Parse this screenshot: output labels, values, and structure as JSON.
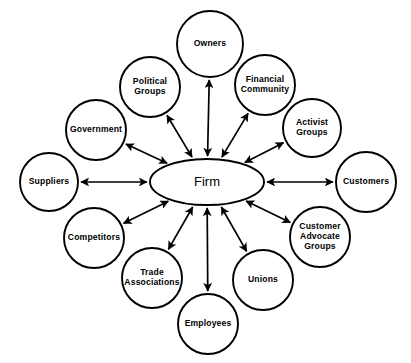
{
  "diagram": {
    "type": "hub-and-spoke stakeholder map",
    "title": "",
    "hub": {
      "id": "firm",
      "label": "Firm",
      "shape": "ellipse",
      "cx": 207,
      "cy": 182,
      "rx": 57,
      "ry": 23
    },
    "colors": {
      "background": "#ffffff",
      "stroke": "#000000",
      "node_fill": "#ffffff",
      "text": "#000000"
    },
    "arrow_style": "double-headed",
    "nodes": [
      {
        "id": "owners",
        "label": "Owners",
        "lines": [
          "Owners"
        ],
        "cx": 210,
        "cy": 44,
        "r": 33,
        "connection": "bidirectional"
      },
      {
        "id": "political-groups",
        "label": "Political Groups",
        "lines": [
          "Political",
          "Groups"
        ],
        "cx": 150,
        "cy": 87,
        "r": 30,
        "connection": "bidirectional"
      },
      {
        "id": "financial-community",
        "label": "Financial Community",
        "lines": [
          "Financial",
          "Community"
        ],
        "cx": 265,
        "cy": 85,
        "r": 30,
        "connection": "bidirectional"
      },
      {
        "id": "government",
        "label": "Government",
        "lines": [
          "Government"
        ],
        "cx": 96,
        "cy": 130,
        "r": 30,
        "connection": "bidirectional"
      },
      {
        "id": "activist-groups",
        "label": "Activist Groups",
        "lines": [
          "Activist",
          "Groups"
        ],
        "cx": 312,
        "cy": 128,
        "r": 29,
        "connection": "bidirectional"
      },
      {
        "id": "suppliers",
        "label": "Suppliers",
        "lines": [
          "Suppliers"
        ],
        "cx": 49,
        "cy": 182,
        "r": 29,
        "connection": "bidirectional"
      },
      {
        "id": "customers",
        "label": "Customers",
        "lines": [
          "Customers"
        ],
        "cx": 366,
        "cy": 182,
        "r": 30,
        "connection": "bidirectional"
      },
      {
        "id": "competitors",
        "label": "Competitors",
        "lines": [
          "Competitors"
        ],
        "cx": 94,
        "cy": 238,
        "r": 30,
        "connection": "bidirectional"
      },
      {
        "id": "customer-advocate-groups",
        "label": "Customer Advocate Groups",
        "lines": [
          "Customer",
          "Advocate",
          "Groups"
        ],
        "cx": 320,
        "cy": 237,
        "r": 30,
        "connection": "bidirectional"
      },
      {
        "id": "trade-associations",
        "label": "Trade Associations",
        "lines": [
          "Trade",
          "Associations"
        ],
        "cx": 152,
        "cy": 278,
        "r": 30,
        "connection": "bidirectional"
      },
      {
        "id": "unions",
        "label": "Unions",
        "lines": [
          "Unions"
        ],
        "cx": 263,
        "cy": 280,
        "r": 30,
        "connection": "bidirectional"
      },
      {
        "id": "employees",
        "label": "Employees",
        "lines": [
          "Employees"
        ],
        "cx": 208,
        "cy": 324,
        "r": 30,
        "connection": "bidirectional"
      }
    ]
  }
}
